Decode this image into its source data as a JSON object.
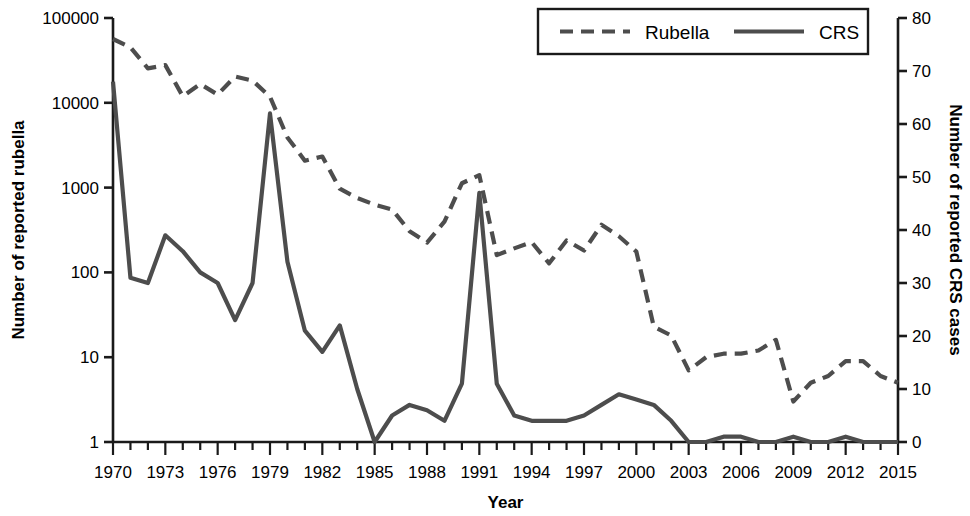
{
  "chart_data": {
    "type": "line",
    "title": "",
    "xlabel": "Year",
    "ylabel": "Number of reported rubella",
    "y2label": "Number of reported CRS cases",
    "x": [
      1970,
      1971,
      1972,
      1973,
      1974,
      1975,
      1976,
      1977,
      1978,
      1979,
      1980,
      1981,
      1982,
      1983,
      1984,
      1985,
      1986,
      1987,
      1988,
      1989,
      1990,
      1991,
      1992,
      1993,
      1994,
      1995,
      1996,
      1997,
      1998,
      1999,
      2000,
      2001,
      2002,
      2003,
      2004,
      2005,
      2006,
      2007,
      2008,
      2009,
      2010,
      2011,
      2012,
      2013,
      2014,
      2015
    ],
    "xtick_labels": [
      "1970",
      "1973",
      "1976",
      "1979",
      "1982",
      "1985",
      "1988",
      "1991",
      "1994",
      "1997",
      "2000",
      "2003",
      "2006",
      "2009",
      "2012",
      "2015"
    ],
    "xtick_values": [
      1970,
      1973,
      1976,
      1979,
      1982,
      1985,
      1988,
      1991,
      1994,
      1997,
      2000,
      2003,
      2006,
      2009,
      2012,
      2015
    ],
    "xlim": [
      1970,
      2015
    ],
    "yscale": "log",
    "ylim": [
      1,
      100000
    ],
    "ytick_labels": [
      "1",
      "10",
      "100",
      "1000",
      "10000",
      "100000"
    ],
    "ytick_values": [
      1,
      10,
      100,
      1000,
      10000,
      100000
    ],
    "y2lim": [
      0,
      80
    ],
    "y2tick_labels": [
      "0",
      "10",
      "20",
      "30",
      "40",
      "50",
      "60",
      "70",
      "80"
    ],
    "y2tick_values": [
      0,
      10,
      20,
      30,
      40,
      50,
      60,
      70,
      80
    ],
    "grid": false,
    "legend_position": "top-right",
    "series": [
      {
        "name": "Rubella",
        "axis": "left",
        "style": "dashed",
        "color": "#4d4d4d",
        "values": [
          56552,
          45086,
          25507,
          27804,
          11917,
          16652,
          12491,
          20395,
          18269,
          11795,
          3904,
          2077,
          2325,
          970,
          752,
          630,
          551,
          306,
          225,
          396,
          1125,
          1401,
          160,
          192,
          227,
          128,
          238,
          181,
          364,
          267,
          176,
          23,
          18,
          7,
          10,
          11,
          11,
          12,
          16,
          3,
          5,
          6,
          9,
          9,
          6,
          5
        ]
      },
      {
        "name": "CRS",
        "axis": "right",
        "style": "solid",
        "color": "#4d4d4d",
        "values": [
          68,
          31,
          30,
          39,
          36,
          32,
          30,
          23,
          30,
          62,
          34,
          21,
          17,
          22,
          10,
          0,
          5,
          7,
          6,
          4,
          11,
          47,
          11,
          5,
          4,
          4,
          4,
          5,
          7,
          9,
          8,
          7,
          4,
          0,
          0,
          1,
          1,
          0,
          0,
          1,
          0,
          0,
          1,
          0,
          0,
          0
        ]
      }
    ],
    "legend": [
      {
        "label": "Rubella",
        "style": "dashed"
      },
      {
        "label": "CRS",
        "style": "solid"
      }
    ]
  }
}
